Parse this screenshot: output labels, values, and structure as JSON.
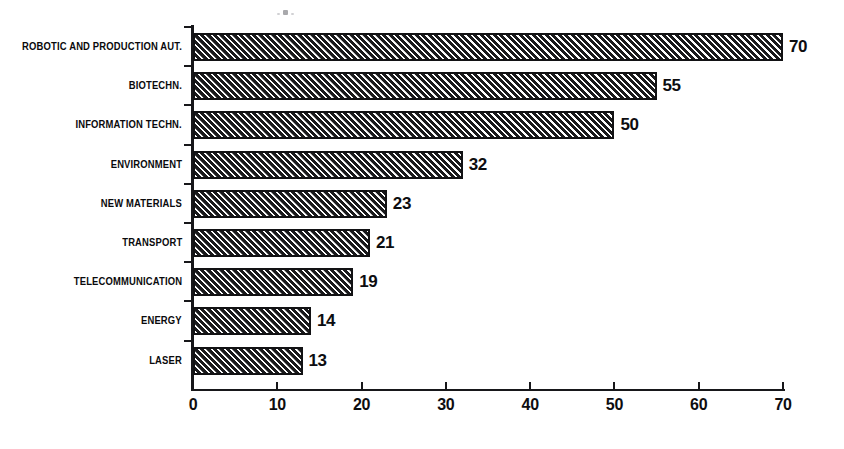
{
  "chart_data": {
    "type": "bar",
    "orientation": "horizontal",
    "title": "",
    "subtitle": "",
    "xlabel": "",
    "ylabel": "",
    "xlim": [
      0,
      70
    ],
    "xticks": [
      0,
      10,
      20,
      30,
      40,
      50,
      60,
      70
    ],
    "xtick_labels": [
      "0",
      "10",
      "20",
      "30",
      "40",
      "50",
      "60",
      "70"
    ],
    "grid": false,
    "legend": null,
    "categories": [
      "ROBOTIC AND PRODUCTION AUT.",
      "BIOTECHN.",
      "INFORMATION TECHN.",
      "ENVIRONMENT",
      "NEW MATERIALS",
      "TRANSPORT",
      "TELECOMMUNICATION",
      "ENERGY",
      "LASER"
    ],
    "values": [
      70,
      55,
      50,
      32,
      23,
      21,
      19,
      14,
      13
    ],
    "value_labels": [
      "70",
      "55",
      "50",
      "32",
      "23",
      "21",
      "19",
      "14",
      "13"
    ],
    "bar_fill": "diagonal-hatch",
    "bar_color": "#1a1a1c",
    "axis_color": "#17171a",
    "background_color": "#ffffff"
  },
  "artifacts": {
    "speck_label": "scan-artifact"
  }
}
